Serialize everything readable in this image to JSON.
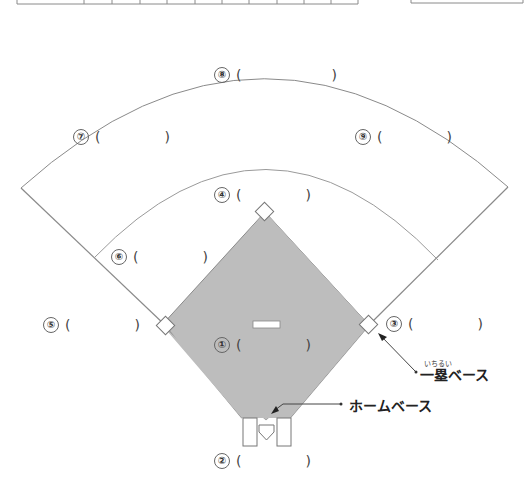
{
  "top_table": {
    "column_dividers_x": [
      17,
      84,
      112,
      140,
      167,
      195,
      222,
      249,
      277,
      304,
      331,
      358
    ]
  },
  "top_box": {
    "left": 411,
    "right": 523
  },
  "colors": {
    "infield_fill": "#bdbdbd",
    "line": "#7a7a7a",
    "base_fill": "#ffffff",
    "text": "#333333"
  },
  "positions": [
    {
      "number": "①",
      "open": "(",
      "close": ")"
    },
    {
      "number": "②",
      "open": "(",
      "close": ")"
    },
    {
      "number": "③",
      "open": "(",
      "close": ")"
    },
    {
      "number": "④",
      "open": "(",
      "close": ")"
    },
    {
      "number": "⑤",
      "open": "(",
      "close": ")"
    },
    {
      "number": "⑥",
      "open": "(",
      "close": ")"
    },
    {
      "number": "⑦",
      "open": "(",
      "close": ")"
    },
    {
      "number": "⑧",
      "open": "(",
      "close": ")"
    },
    {
      "number": "⑨",
      "open": "(",
      "close": ")"
    }
  ],
  "callouts": {
    "first_base": {
      "label": "一塁ベース",
      "ruby": "いちるい"
    },
    "home_base": {
      "label": "ホームベース"
    }
  }
}
